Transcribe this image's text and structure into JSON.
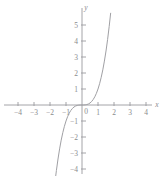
{
  "figure": {
    "caption_fragment": "y, ƒ(x) = x³",
    "background_color": "#ffffff",
    "axis_color": "#9a9a9e",
    "curve_color": "#a0a0a4",
    "label_color": "#8a8a8e"
  },
  "chart_data": {
    "type": "line",
    "title": "",
    "subtitle": "",
    "function": "y = x^3",
    "xlabel": "x",
    "ylabel": "y",
    "xlim": [
      -4.9,
      4.9
    ],
    "ylim": [
      -4.6,
      5.8
    ],
    "grid": false,
    "legend": false,
    "legend_position": "none",
    "x_ticks": [
      -4,
      -3,
      -2,
      -1,
      1,
      2,
      3,
      4
    ],
    "x_tick_labels": [
      "-4",
      "-3",
      "-2",
      "-1",
      "1",
      "2",
      "3",
      "4"
    ],
    "y_ticks": [
      -4,
      -3,
      -2,
      -1,
      1,
      2,
      3,
      4,
      5
    ],
    "y_tick_labels": [
      "-4",
      "-3",
      "-2",
      "-1",
      "1",
      "2",
      "3",
      "4",
      "5"
    ],
    "origin_label": "0",
    "series": [
      {
        "name": "y = x^3",
        "color": "#a0a0a4",
        "x": [
          -1.665,
          -1.6,
          -1.5,
          -1.4,
          -1.3,
          -1.2,
          -1.1,
          -1.0,
          -0.9,
          -0.8,
          -0.7,
          -0.6,
          -0.5,
          -0.4,
          -0.3,
          -0.2,
          -0.1,
          0.0,
          0.1,
          0.2,
          0.3,
          0.4,
          0.5,
          0.6,
          0.7,
          0.8,
          0.9,
          1.0,
          1.1,
          1.2,
          1.3,
          1.4,
          1.5,
          1.6,
          1.7,
          1.79
        ],
        "y": [
          -4.615,
          -4.096,
          -3.375,
          -2.744,
          -2.197,
          -1.728,
          -1.331,
          -1.0,
          -0.729,
          -0.512,
          -0.343,
          -0.216,
          -0.125,
          -0.064,
          -0.027,
          -0.008,
          -0.001,
          0.0,
          0.001,
          0.008,
          0.027,
          0.064,
          0.125,
          0.216,
          0.343,
          0.512,
          0.729,
          1.0,
          1.331,
          1.728,
          2.197,
          2.744,
          3.375,
          4.096,
          4.913,
          5.735
        ]
      }
    ],
    "annotations": []
  }
}
